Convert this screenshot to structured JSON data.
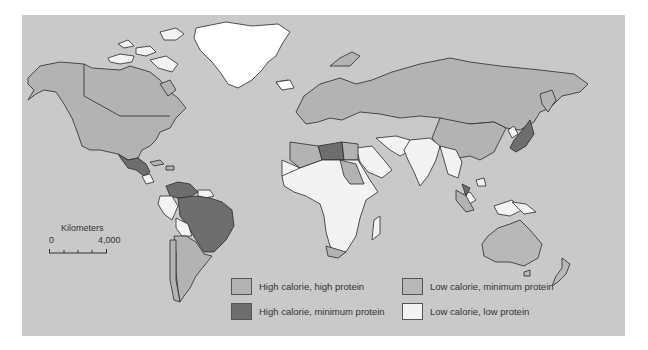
{
  "map": {
    "colors": {
      "ocean": "#c9c9c9",
      "high_calorie_high_protein": "#b3b3b3",
      "high_calorie_minimum_protein": "#6e6e6e",
      "low_calorie_minimum_protein": "#b8b8b8",
      "low_calorie_low_protein": "#f3f3f3",
      "border": "#2a2a2a"
    }
  },
  "scale": {
    "title": "Kilometers",
    "min_label": "0",
    "max_label": "4,000"
  },
  "legend": {
    "items": [
      {
        "label": "High calorie, high protein",
        "color": "#b3b3b3"
      },
      {
        "label": "High calorie, minimum protein",
        "color": "#6e6e6e"
      },
      {
        "label": "Low calorie, minimum protein",
        "color": "#b8b8b8"
      },
      {
        "label": "Low calorie, low protein",
        "color": "#f3f3f3"
      }
    ]
  }
}
